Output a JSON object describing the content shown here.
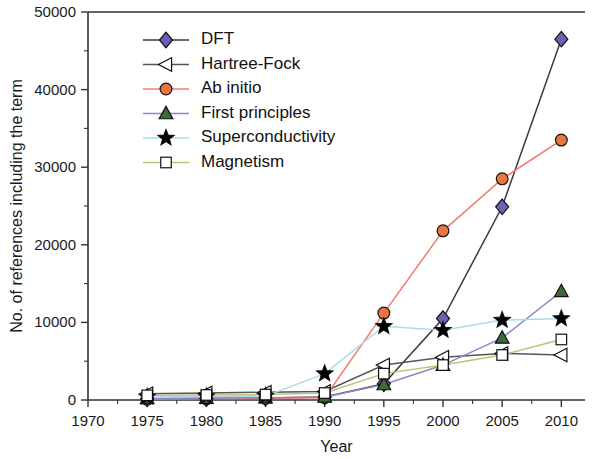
{
  "chart_data": {
    "type": "line",
    "title": "",
    "xlabel": "Year",
    "ylabel": "No. of references including the term",
    "x": [
      1975,
      1980,
      1985,
      1990,
      1995,
      2000,
      2005,
      2010
    ],
    "xlim": [
      1970,
      2012
    ],
    "ylim": [
      0,
      50000
    ],
    "xticks": [
      1970,
      1975,
      1980,
      1985,
      1990,
      1995,
      2000,
      2005,
      2010
    ],
    "xtick_labels": [
      "1970",
      "1975",
      "1980",
      "1985",
      "1990",
      "1995",
      "2000",
      "2005",
      "2010"
    ],
    "yticks": [
      0,
      10000,
      20000,
      30000,
      40000,
      50000
    ],
    "ytick_labels": [
      "0",
      "10000",
      "20000",
      "30000",
      "40000",
      "50000"
    ],
    "minor_ticks": true,
    "grid": false,
    "legend_position": "upper-left",
    "series": [
      {
        "name": "DFT",
        "marker": "diamond",
        "marker_color": "#6B62B5",
        "line_color": "#3a3a3a",
        "values": [
          150,
          200,
          250,
          400,
          2100,
          10500,
          24900,
          46500
        ]
      },
      {
        "name": "Hartree-Fock",
        "marker": "left-triangle",
        "marker_color": "#ffffff",
        "line_color": "#555555",
        "values": [
          800,
          900,
          1000,
          1100,
          4500,
          5500,
          6000,
          5800
        ]
      },
      {
        "name": "Ab initio",
        "marker": "circle",
        "marker_color": "#E8763E",
        "line_color": "#F07B72",
        "values": [
          100,
          150,
          200,
          300,
          11200,
          21800,
          28500,
          33500
        ]
      },
      {
        "name": "First principles",
        "marker": "triangle",
        "marker_color": "#3C6B3A",
        "line_color": "#8F85C9",
        "values": [
          200,
          250,
          300,
          400,
          2000,
          4500,
          8000,
          14000
        ]
      },
      {
        "name": "Superconductivity",
        "marker": "star",
        "marker_color": "#000000",
        "line_color": "#A9DCE8",
        "values": [
          400,
          450,
          500,
          3400,
          9500,
          9000,
          10300,
          10500
        ]
      },
      {
        "name": "Magnetism",
        "marker": "square",
        "marker_color": "#ffffff",
        "line_color": "#C3C078",
        "values": [
          600,
          650,
          700,
          900,
          3400,
          4500,
          5800,
          7800
        ]
      }
    ]
  }
}
